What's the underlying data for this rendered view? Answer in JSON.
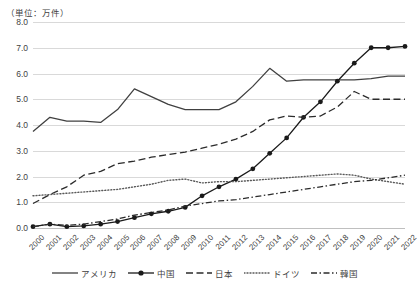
{
  "unit_note": "（単位：万件）",
  "chart_data": {
    "type": "line",
    "title": "",
    "subtitle": "",
    "xlabel": "",
    "ylabel": "（単位：万件）",
    "unit": "万件",
    "grid": true,
    "legend_position": "bottom",
    "ylim": [
      0.0,
      8.0
    ],
    "ytick_step": 1.0,
    "yticks": [
      "0.0",
      "1.0",
      "2.0",
      "3.0",
      "4.0",
      "5.0",
      "6.0",
      "7.0",
      "8.0"
    ],
    "categories": [
      "2000",
      "2001",
      "2002",
      "2003",
      "2004",
      "2005",
      "2006",
      "2007",
      "2008",
      "2009",
      "2010",
      "2011",
      "2012",
      "2013",
      "2014",
      "2015",
      "2016",
      "2017",
      "2018",
      "2019",
      "2020",
      "2021",
      "2022"
    ],
    "series": [
      {
        "name": "アメリカ",
        "style": "solid",
        "color": "#404040",
        "marker": "none",
        "values": [
          3.75,
          4.3,
          4.15,
          4.15,
          4.1,
          4.6,
          5.4,
          5.1,
          4.8,
          4.6,
          4.6,
          4.6,
          4.9,
          5.5,
          6.2,
          5.7,
          5.75,
          5.75,
          5.75,
          5.75,
          5.8,
          5.9,
          5.9
        ]
      },
      {
        "name": "中国",
        "style": "solid",
        "color": "#1a1a1a",
        "marker": "circle",
        "values": [
          0.05,
          0.15,
          0.05,
          0.08,
          0.15,
          0.25,
          0.4,
          0.55,
          0.65,
          0.8,
          1.25,
          1.6,
          1.9,
          2.3,
          2.9,
          3.5,
          4.3,
          4.9,
          5.7,
          6.4,
          7.0,
          7.0,
          7.05
        ]
      },
      {
        "name": "日本",
        "style": "dashed",
        "color": "#2b2b2b",
        "marker": "none",
        "values": [
          0.95,
          1.3,
          1.6,
          2.05,
          2.2,
          2.5,
          2.6,
          2.75,
          2.85,
          2.95,
          3.1,
          3.25,
          3.45,
          3.75,
          4.2,
          4.35,
          4.3,
          4.35,
          4.7,
          5.3,
          5.0,
          5.0,
          5.0
        ]
      },
      {
        "name": "ドイツ",
        "style": "dotted",
        "color": "#595959",
        "marker": "none",
        "values": [
          1.25,
          1.3,
          1.35,
          1.4,
          1.45,
          1.5,
          1.6,
          1.7,
          1.85,
          1.9,
          1.75,
          1.8,
          1.8,
          1.85,
          1.9,
          1.95,
          2.0,
          2.05,
          2.1,
          2.05,
          1.9,
          1.8,
          1.7
        ]
      },
      {
        "name": "韓国",
        "style": "dashdot",
        "color": "#2b2b2b",
        "marker": "none",
        "values": [
          0.05,
          0.15,
          0.1,
          0.15,
          0.25,
          0.35,
          0.5,
          0.6,
          0.7,
          0.85,
          0.95,
          1.05,
          1.1,
          1.2,
          1.3,
          1.4,
          1.5,
          1.6,
          1.7,
          1.8,
          1.85,
          1.95,
          2.05
        ]
      }
    ]
  }
}
